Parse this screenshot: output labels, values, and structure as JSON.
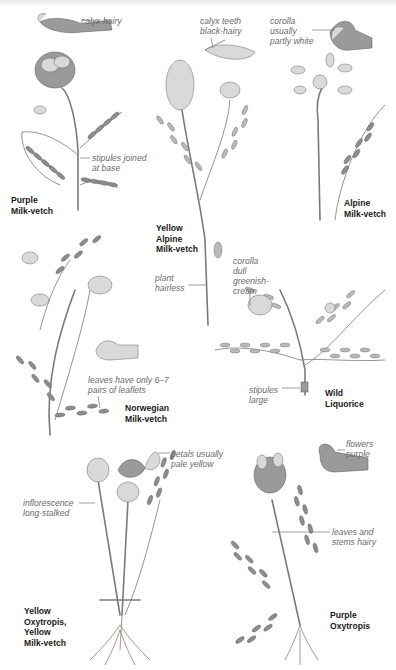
{
  "page": {
    "background": "#ffffff",
    "text_color_label": "#1a1a1a",
    "text_color_annotation": "#6a6a6a"
  },
  "species": [
    {
      "id": "purple-milk-vetch",
      "name": "Purple\nMilk-vetch",
      "notes": [
        "calyx hairy",
        "stipules joined\nat base"
      ]
    },
    {
      "id": "yellow-alpine-milk-vetch",
      "name": "Yellow\nAlpine\nMilk-vetch",
      "notes": [
        "calyx teeth\nblack-hairy",
        "plant\nhairless"
      ]
    },
    {
      "id": "alpine-milk-vetch",
      "name": "Alpine\nMilk-vetch",
      "notes": [
        "corolla\nusually\npartly white"
      ]
    },
    {
      "id": "norwegian-milk-vetch",
      "name": "Norwegian\nMilk-vetch",
      "notes": [
        "leaves have only 6–7\npairs of leaflets"
      ]
    },
    {
      "id": "wild-liquorice",
      "name": "Wild\nLiquorice",
      "notes": [
        "corolla\ndull\ngreenish-\ncream",
        "stipules\nlarge"
      ]
    },
    {
      "id": "yellow-oxytropis",
      "name": "Yellow\nOxytropis,\nYellow\nMilk-vetch",
      "notes": [
        "petals usually\npale yellow",
        "inflorescence\nlong-stalked"
      ]
    },
    {
      "id": "purple-oxytropis",
      "name": "Purple\nOxytropis",
      "notes": [
        "flowers\npurple",
        "leaves and\nstems hairy"
      ]
    }
  ]
}
